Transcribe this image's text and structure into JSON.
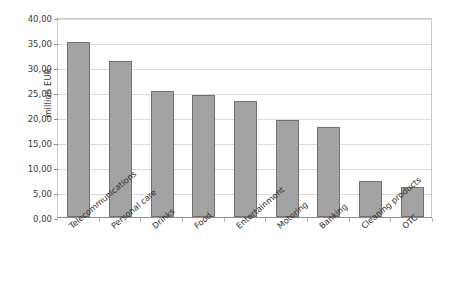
{
  "chart_data": {
    "type": "bar",
    "title": "",
    "xlabel": "",
    "ylabel": "million EUR",
    "categories": [
      "Telecommunications",
      "Personal care",
      "Drinks",
      "Food",
      "Entertainment",
      "Motoring",
      "Banking",
      "Cleaning products",
      "OTC"
    ],
    "values": [
      35.0,
      31.2,
      25.3,
      24.5,
      23.3,
      19.4,
      18.1,
      7.3,
      6.1
    ],
    "ylim": [
      0,
      40
    ],
    "ytick_values": [
      0,
      5,
      10,
      15,
      20,
      25,
      30,
      35,
      40
    ],
    "ytick_labels": [
      "0,00",
      "5,00",
      "10,00",
      "15,00",
      "20,00",
      "25,00",
      "30,00",
      "35,00",
      "40,00"
    ],
    "grid": true,
    "legend": false,
    "legend_position": "none",
    "series": [
      {
        "name": "million EUR",
        "values": [
          35.0,
          31.2,
          25.3,
          24.5,
          23.3,
          19.4,
          18.1,
          7.3,
          6.1
        ]
      }
    ]
  },
  "style": {
    "bar_fill": "#a3a3a3",
    "bar_edge": "#707070",
    "grid_color": "#d9d9d9",
    "frame_color": "#c9c9c9",
    "axis_color": "#8c8c8c",
    "text_color": "#2f2f2f",
    "background": "#ffffff"
  }
}
